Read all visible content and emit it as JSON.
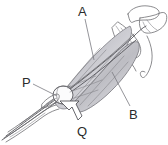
{
  "figure": {
    "background_color": "#ffffff",
    "line_color": "#6e6e72",
    "label_color": "#2b2b2b",
    "shade_light": "#e9e9ec",
    "shade_mid": "#d2d2d6",
    "shade_dark": "#b9b9be",
    "width": 168,
    "height": 145
  },
  "labels": [
    {
      "id": "A",
      "text": "A",
      "x": 78,
      "y": 16,
      "pointer": "leader-line"
    },
    {
      "id": "B",
      "text": "B",
      "x": 129,
      "y": 119,
      "pointer": "leader-line"
    },
    {
      "id": "P",
      "text": "P",
      "x": 22,
      "y": 87,
      "pointer": "leader-line"
    },
    {
      "id": "Q",
      "text": "Q",
      "x": 77,
      "y": 136,
      "pointer": "hollow-arrow"
    }
  ],
  "leaders": {
    "a_line": "M 85,19 L 94,60",
    "b_line": "M 112,72 L 130,106",
    "p_line": "M 33,84 L 57,96"
  },
  "arrow": {
    "name": "hollow-arrow-q",
    "path": "M 60,101 L 69,110 L 72,107 L 78,120 L 82,116 L 76,104 L 79,101 Z"
  }
}
